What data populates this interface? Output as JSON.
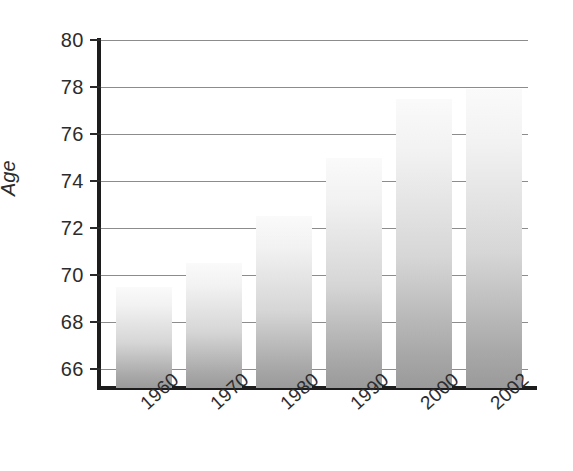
{
  "chart_data": {
    "type": "bar",
    "title": "",
    "xlabel": "",
    "ylabel": "Age",
    "categories": [
      "1960",
      "1970",
      "1980",
      "1990",
      "2000",
      "2002"
    ],
    "values": [
      69.5,
      70.5,
      72.5,
      75.0,
      77.5,
      77.9
    ],
    "ylim": [
      65.2,
      80
    ],
    "yticks": [
      66,
      68,
      70,
      72,
      74,
      76,
      78,
      80
    ],
    "ytick_labels": [
      "66",
      "68",
      "70",
      "72",
      "74",
      "76",
      "78",
      "80"
    ],
    "grid": true,
    "legend": "none",
    "series": [
      {
        "name": "Life expectancy",
        "values": [
          69.5,
          70.5,
          72.5,
          75.0,
          77.5,
          77.9
        ]
      }
    ],
    "bar_fill_top_color": "#fafafa",
    "bar_fill_bottom_color": "#9a9a9a",
    "axis_color": "#1c1c1c",
    "gridline_color": "#8c8c8c",
    "text_color": "#2c2c2c"
  }
}
